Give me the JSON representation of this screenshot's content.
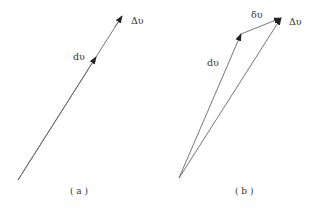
{
  "figure_a": {
    "caption": "( a )",
    "labels": {
      "dv": "dυ",
      "delta_v": "Δυ"
    },
    "vectors": [
      {
        "name": "dv",
        "from": [
          18,
          180
        ],
        "to": [
          96,
          57
        ]
      },
      {
        "name": "delta_v",
        "from": [
          18,
          180
        ],
        "to": [
          122,
          16
        ]
      }
    ]
  },
  "figure_b": {
    "caption": "( b )",
    "labels": {
      "dv": "dυ",
      "small_delta_v": "δυ",
      "delta_v": "Δυ"
    },
    "vectors": [
      {
        "name": "dv",
        "from": [
          179,
          178
        ],
        "to": [
          241,
          34
        ]
      },
      {
        "name": "small_delta_v",
        "from": [
          241,
          34
        ],
        "to": [
          281,
          18
        ]
      },
      {
        "name": "delta_v",
        "from": [
          179,
          178
        ],
        "to": [
          281,
          18
        ]
      }
    ]
  },
  "colors": {
    "line": "#666666",
    "arrow": "#222222",
    "text": "#333333"
  }
}
